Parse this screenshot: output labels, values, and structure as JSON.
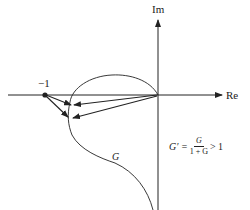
{
  "diagram": {
    "axes": {
      "x_label": "Re",
      "y_label": "Im"
    },
    "point_label": "−1",
    "curve_label": "G",
    "equation": {
      "lhs": "G′ =",
      "numerator": "G",
      "denominator": "1 + G",
      "rhs": "> 1"
    },
    "colors": {
      "ink": "#222222",
      "background": "#ffffff"
    }
  }
}
